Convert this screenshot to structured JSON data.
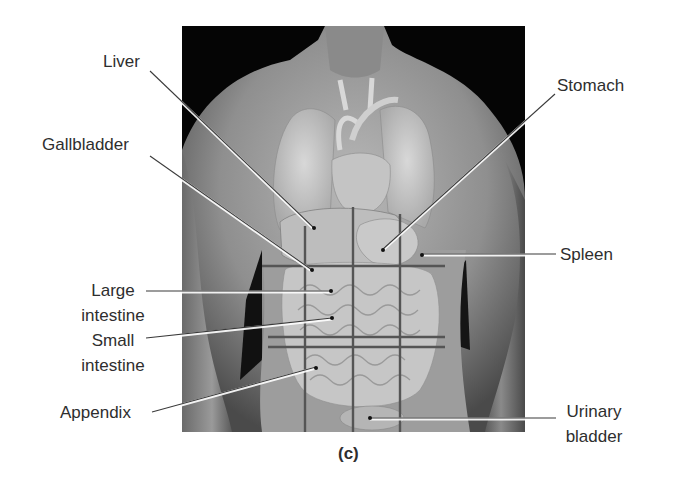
{
  "figure": {
    "caption": "(c)",
    "photo_description": "Male torso with superimposed internal organs and abdominopelvic quadrant/region grid lines",
    "colors": {
      "background": "#ffffff",
      "photo_background": "#050505",
      "label_text": "#2e2e2e",
      "leader_line": "#333333",
      "grid_line": "#555555"
    },
    "labels": {
      "liver": {
        "lines": [
          "Liver"
        ]
      },
      "gallbladder": {
        "lines": [
          "Gallbladder"
        ]
      },
      "stomach": {
        "lines": [
          "Stomach"
        ]
      },
      "spleen": {
        "lines": [
          "Spleen"
        ]
      },
      "large_intestine": {
        "lines": [
          "Large",
          "intestine"
        ]
      },
      "small_intestine": {
        "lines": [
          "Small",
          "intestine"
        ]
      },
      "appendix": {
        "lines": [
          "Appendix"
        ]
      },
      "urinary_bladder": {
        "lines": [
          "Urinary",
          "bladder"
        ]
      }
    }
  }
}
